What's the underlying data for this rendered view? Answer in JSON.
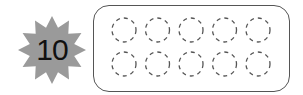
{
  "badge": {
    "number": "10",
    "color": "#9a9a9a",
    "points": 12
  },
  "ten_frame": {
    "rows": 2,
    "cols": 5,
    "cells": [
      {
        "filled": false
      },
      {
        "filled": false
      },
      {
        "filled": false
      },
      {
        "filled": false
      },
      {
        "filled": false
      },
      {
        "filled": false
      },
      {
        "filled": false
      },
      {
        "filled": false
      },
      {
        "filled": false
      },
      {
        "filled": false
      }
    ],
    "stroke_color": "#555555"
  }
}
